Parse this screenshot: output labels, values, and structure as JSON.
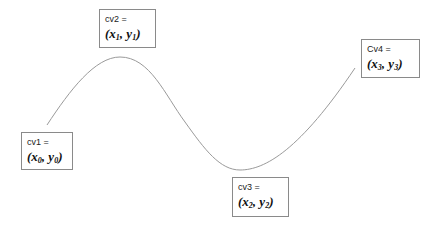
{
  "diagram": {
    "curve": {
      "stroke_color": "#9a9a9a",
      "points": [
        [
          47,
          125
        ],
        [
          120,
          57
        ],
        [
          240,
          170
        ],
        [
          355,
          68
        ]
      ]
    },
    "control_points": [
      {
        "id": "cv1",
        "label": "cv1 =",
        "x_var": "x",
        "x_sub": "0",
        "y_var": "y",
        "y_sub": "0",
        "box": {
          "left": 21,
          "top": 132,
          "width": 52,
          "height": 38
        }
      },
      {
        "id": "cv2",
        "label": "cv2 =",
        "x_var": "x",
        "x_sub": "1",
        "y_var": "y",
        "y_sub": "1",
        "box": {
          "left": 99,
          "top": 9,
          "width": 57,
          "height": 39
        }
      },
      {
        "id": "cv3",
        "label": "cv3 =",
        "x_var": "x",
        "x_sub": "2",
        "y_var": "y",
        "y_sub": "2",
        "box": {
          "left": 232,
          "top": 177,
          "width": 57,
          "height": 40
        }
      },
      {
        "id": "cv4",
        "label": "Cv4 =",
        "x_var": "x",
        "x_sub": "3",
        "y_var": "y",
        "y_sub": "3",
        "box": {
          "left": 361,
          "top": 39,
          "width": 59,
          "height": 39
        }
      }
    ]
  }
}
